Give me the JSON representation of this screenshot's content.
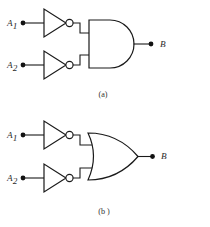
{
  "figure": {
    "background_color": "#ffffff",
    "line_color": "#1a1a1a",
    "panels": [
      {
        "id": "panel-a",
        "caption": "(a)",
        "gate_type": "AND",
        "description": "Two inverters feeding a two-input AND gate",
        "inputs": [
          {
            "label": "A",
            "subscript": "1"
          },
          {
            "label": "A",
            "subscript": "2"
          }
        ],
        "output": {
          "label": "B"
        }
      },
      {
        "id": "panel-b",
        "caption": "(b )",
        "gate_type": "OR",
        "description": "Two inverters feeding a two-input OR gate",
        "inputs": [
          {
            "label": "A",
            "subscript": "1"
          },
          {
            "label": "A",
            "subscript": "2"
          }
        ],
        "output": {
          "label": "B"
        }
      }
    ]
  }
}
